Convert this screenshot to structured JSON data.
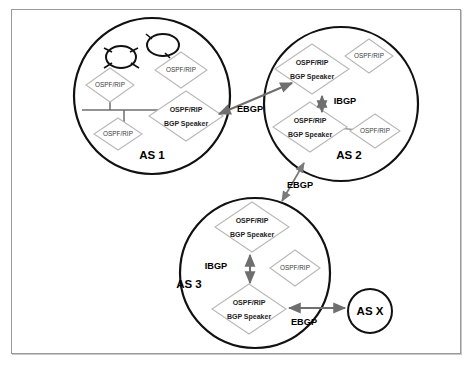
{
  "diagram": {
    "border_color": "#9a9a9a",
    "background": "#ffffff",
    "node_stroke": "#b8b8b8",
    "circle_stroke": "#111111",
    "arrow_color": "#6f6f6f"
  },
  "autonomous_systems": [
    {
      "id": "as1",
      "label": "AS 1",
      "cx": 152,
      "cy": 96,
      "r": 78,
      "clouds": [
        {
          "cx": 121,
          "cy": 57,
          "rx": 15,
          "ry": 11
        },
        {
          "cx": 163,
          "cy": 45,
          "rx": 16,
          "ry": 11
        }
      ],
      "nodes": [
        {
          "id": "as1-n1",
          "label_lines": [
            "OSPF/RIP"
          ],
          "cx": 110,
          "cy": 85,
          "rx": 24,
          "ry": 17,
          "bgp": false
        },
        {
          "id": "as1-n2",
          "label_lines": [
            "OSPF/RIP"
          ],
          "cx": 118,
          "cy": 134,
          "rx": 24,
          "ry": 16,
          "bgp": false
        },
        {
          "id": "as1-n3",
          "label_lines": [
            "OSPF/RIP"
          ],
          "cx": 181,
          "cy": 70,
          "rx": 26,
          "ry": 18,
          "bgp": false
        },
        {
          "id": "as1-speaker",
          "label_lines": [
            "OSPF/RIP",
            "BGP Speaker"
          ],
          "cx": 186,
          "cy": 116,
          "rx": 37,
          "ry": 25,
          "bgp": true
        }
      ]
    },
    {
      "id": "as2",
      "label": "AS 2",
      "cx": 341,
      "cy": 104,
      "r": 77,
      "clouds": [],
      "nodes": [
        {
          "id": "as2-speaker-top",
          "label_lines": [
            "OSPF/RIP",
            "BGP Speaker"
          ],
          "cx": 312,
          "cy": 69,
          "rx": 37,
          "ry": 25,
          "bgp": true
        },
        {
          "id": "as2-n1",
          "label_lines": [
            "OSPF/RIP"
          ],
          "cx": 369,
          "cy": 56,
          "rx": 24,
          "ry": 17,
          "bgp": false
        },
        {
          "id": "as2-speaker-bottom",
          "label_lines": [
            "OSPF/RIP",
            "BGP Speaker"
          ],
          "cx": 310,
          "cy": 127,
          "rx": 37,
          "ry": 25,
          "bgp": true
        },
        {
          "id": "as2-n2",
          "label_lines": [
            "OSPF/RIP"
          ],
          "cx": 375,
          "cy": 131,
          "rx": 25,
          "ry": 17,
          "bgp": false
        }
      ]
    },
    {
      "id": "as3",
      "label": "AS 3",
      "cx": 255,
      "cy": 273,
      "r": 75,
      "clouds": [],
      "nodes": [
        {
          "id": "as3-speaker-top",
          "label_lines": [
            "OSPF/RIP",
            "BGP Speaker"
          ],
          "cx": 252,
          "cy": 227,
          "rx": 37,
          "ry": 25,
          "bgp": true
        },
        {
          "id": "as3-n1",
          "label_lines": [
            "OSPF/RIP"
          ],
          "cx": 295,
          "cy": 268,
          "rx": 25,
          "ry": 18,
          "bgp": false
        },
        {
          "id": "as3-speaker-bottom",
          "label_lines": [
            "OSPF/RIP",
            "BGP Speaker"
          ],
          "cx": 249,
          "cy": 309,
          "rx": 37,
          "ry": 25,
          "bgp": true
        }
      ]
    }
  ],
  "external_as": {
    "id": "asx",
    "label": "AS X",
    "cx": 370,
    "cy": 311,
    "r": 22
  },
  "peering_links": [
    {
      "id": "ebgp-as1-as2",
      "protocol": "EBGP",
      "label_x": 250,
      "label_y": 107,
      "x1": 219,
      "y1": 113,
      "x2": 291,
      "y2": 84
    },
    {
      "id": "ebgp-as2-as3",
      "protocol": "EBGP",
      "label_x": 297,
      "label_y": 186,
      "x1": 281,
      "y1": 199,
      "x2": 303,
      "y2": 163
    },
    {
      "id": "ebgp-as3-asx",
      "protocol": "EBGP",
      "label_x": 304,
      "label_y": 322,
      "x1": 289,
      "y1": 308,
      "x2": 345,
      "y2": 308
    },
    {
      "id": "ibgp-as2",
      "protocol": "IBGP",
      "label_x": 344,
      "label_y": 99,
      "x1": 322,
      "y1": 95,
      "x2": 322,
      "y2": 110
    },
    {
      "id": "ibgp-as3",
      "protocol": "IBGP",
      "label_x": 216,
      "label_y": 267,
      "x1": 250,
      "y1": 255,
      "x2": 250,
      "y2": 283
    }
  ],
  "internal_links": [
    {
      "id": "as1-bus",
      "type": "bus"
    },
    {
      "id": "as2-bottom-link",
      "type": "line"
    }
  ]
}
